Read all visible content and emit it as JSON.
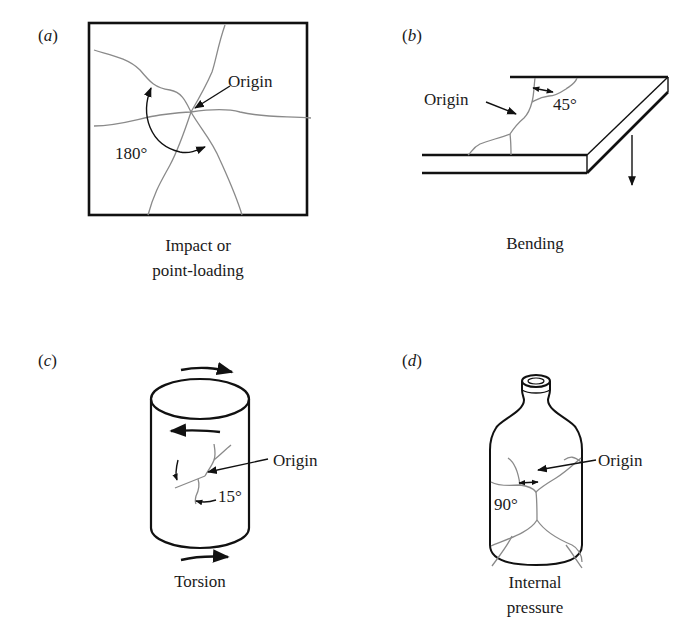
{
  "figure": {
    "panels": [
      {
        "id": "a",
        "letter": "a",
        "caption_lines": [
          "Impact or",
          "point-loading"
        ],
        "origin_label": "Origin",
        "angle_label": "180°",
        "shape": "square plate"
      },
      {
        "id": "b",
        "letter": "b",
        "caption_lines": [
          "Bending"
        ],
        "origin_label": "Origin",
        "angle_label": "45°",
        "shape": "cantilevered plate"
      },
      {
        "id": "c",
        "letter": "c",
        "caption_lines": [
          "Torsion"
        ],
        "origin_label": "Origin",
        "angle_label": "15°",
        "shape": "cylinder"
      },
      {
        "id": "d",
        "letter": "d",
        "caption_lines": [
          "Internal",
          "pressure"
        ],
        "origin_label": "Origin",
        "angle_label": "90°",
        "shape": "bottle"
      }
    ],
    "colors": {
      "outline": "#111111",
      "crack": "#8a8a8a",
      "background": "#ffffff"
    }
  }
}
